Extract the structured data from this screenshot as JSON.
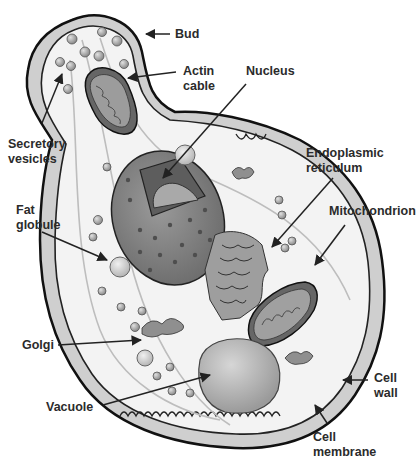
{
  "diagram": {
    "colors": {
      "background": "#ffffff",
      "outline": "#111111",
      "wall": "#cfcfcf",
      "cytoplasm": "#f2f2f2",
      "organelle_dark": "#7a7a7a",
      "organelle_mid": "#a8a8a8",
      "label_text": "#2b2b2b"
    },
    "labels": {
      "bud": "Bud",
      "actin_cable": "Actin\ncable",
      "nucleus": "Nucleus",
      "secretory_vesicles": "Secretory\nvesicles",
      "endoplasmic_reticulum": "Endoplasmic\nreticulum",
      "fat_globule": "Fat\nglobule",
      "mitochondrion": "Mitochondrion",
      "golgi": "Golgi",
      "vacuole": "Vacuole",
      "cell_wall": "Cell\nwall",
      "cell_membrane": "Cell\nmembrane"
    }
  }
}
